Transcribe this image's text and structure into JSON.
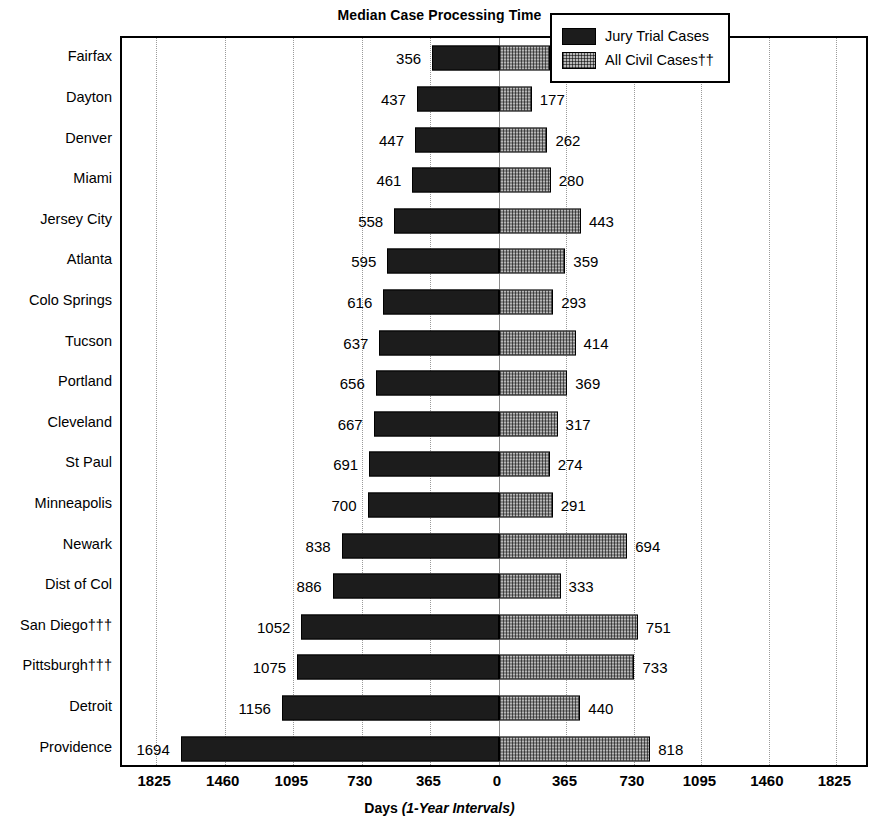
{
  "chart_data": {
    "type": "bar",
    "subtype": "diverging-horizontal-bar",
    "title": "Median Case Processing Time",
    "xlabel": "Days",
    "xlabel_note": "(1-Year Intervals)",
    "ylabel": "",
    "grid": true,
    "legend_position": "top-right",
    "axis_ticks": [
      1825,
      1460,
      1095,
      730,
      365,
      0,
      365,
      730,
      1095,
      1460,
      1825
    ],
    "xlim_left": 1825,
    "xlim_right": 1825,
    "categories": [
      "Fairfax",
      "Dayton",
      "Denver",
      "Miami",
      "Jersey City",
      "Atlanta",
      "Colo Springs",
      "Tucson",
      "Portland",
      "Cleveland",
      "St Paul",
      "Minneapolis",
      "Newark",
      "Dist of Col",
      "San Diego†††",
      "Pittsburgh†††",
      "Detroit",
      "Providence"
    ],
    "series": [
      {
        "name": "Jury Trial Cases",
        "side": "left",
        "fill": "solid-dark",
        "values": [
          356,
          437,
          447,
          461,
          558,
          595,
          616,
          637,
          656,
          667,
          691,
          700,
          838,
          886,
          1052,
          1075,
          1156,
          1694
        ]
      },
      {
        "name": "All Civil Cases††",
        "side": "right",
        "fill": "stipple-gray",
        "values": [
          275,
          177,
          262,
          280,
          443,
          359,
          293,
          414,
          369,
          317,
          274,
          291,
          694,
          333,
          751,
          733,
          440,
          818
        ]
      }
    ],
    "legend": [
      {
        "label": "Jury Trial Cases",
        "swatch": "solid"
      },
      {
        "label": "All Civil Cases††",
        "swatch": "stipple"
      }
    ],
    "colors": {
      "jury_trial_fill": "#1c1c1c",
      "all_civil_fill": "#b8b8b8",
      "frame": "#000000",
      "gridline": "#9a9a9a",
      "background": "#ffffff"
    }
  }
}
